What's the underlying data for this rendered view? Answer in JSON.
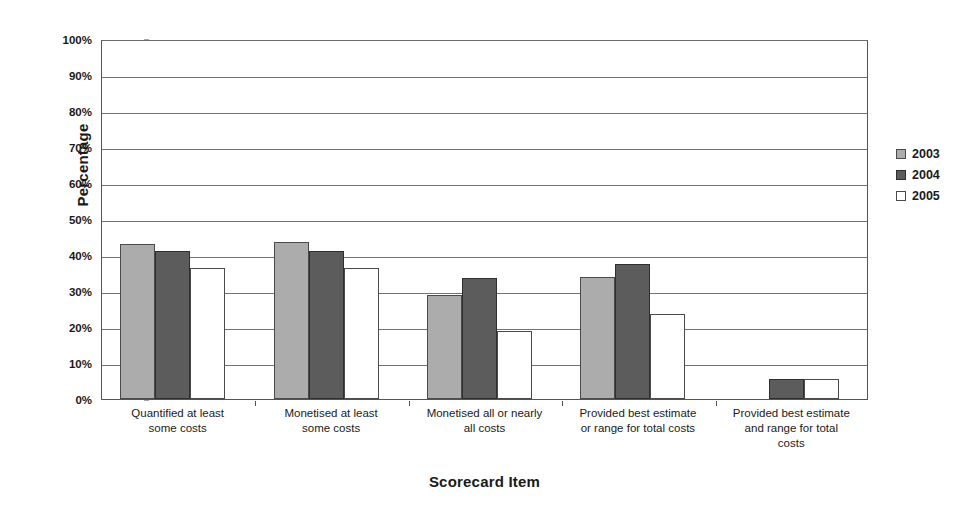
{
  "chart_data": {
    "type": "bar",
    "title": "",
    "xlabel": "Scorecard Item",
    "ylabel": "Percentage",
    "ylim": [
      0,
      100
    ],
    "ytick_labels": [
      "100%",
      "90%",
      "80%",
      "70%",
      "60%",
      "50%",
      "40%",
      "30%",
      "20%",
      "10%",
      "0%"
    ],
    "ytick_values": [
      100,
      90,
      80,
      70,
      60,
      50,
      40,
      30,
      20,
      10,
      0
    ],
    "grid": true,
    "legend_position": "right",
    "value_suffix": "%",
    "categories": [
      "Quantified at least some costs",
      "Monetised at least some costs",
      "Monetised all or nearly all costs",
      "Provided best estimate or range for total costs",
      "Provided best estimate and range for total costs"
    ],
    "category_label_lines": [
      [
        "Quantified at least",
        "some costs"
      ],
      [
        "Monetised at least",
        "some costs"
      ],
      [
        "Monetised all or nearly",
        "all costs"
      ],
      [
        "Provided best estimate",
        "or range for total costs"
      ],
      [
        "Provided best estimate",
        "and range for total",
        "costs"
      ]
    ],
    "series": [
      {
        "name": "2003",
        "color": "#acacac",
        "values": [
          43,
          43.5,
          29,
          34,
          0
        ]
      },
      {
        "name": "2004",
        "color": "#5c5c5c",
        "values": [
          41,
          41,
          33.5,
          37.5,
          5.5
        ]
      },
      {
        "name": "2005",
        "color": "#ffffff",
        "values": [
          36.5,
          36.5,
          19,
          23.5,
          5.5
        ]
      }
    ]
  },
  "legend": {
    "entries": [
      {
        "label": "2003",
        "swatch": "light-gray-swatch"
      },
      {
        "label": "2004",
        "swatch": "dark-gray-swatch"
      },
      {
        "label": "2005",
        "swatch": "white-swatch"
      }
    ]
  },
  "axes": {
    "y_title": "Percentage",
    "x_title": "Scorecard Item"
  }
}
